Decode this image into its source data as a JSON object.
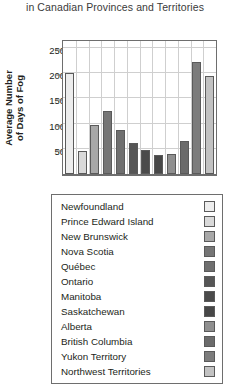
{
  "chart_data": {
    "type": "bar",
    "title": "in Canadian Provinces and Territories",
    "xlabel": "",
    "ylabel": "Average Number of Days of Fog",
    "ylim": [
      0,
      270
    ],
    "yticks": [
      50,
      100,
      150,
      200,
      250
    ],
    "grid": true,
    "legend_position": "below",
    "categories": [
      "Newfoundland",
      "Prince Edward Island",
      "New Brunswick",
      "Nova Scotia",
      "Québec",
      "Ontario",
      "Manitoba",
      "Saskatchewan",
      "Alberta",
      "British Columbia",
      "Yukon Territory",
      "Northwest Territories"
    ],
    "values": [
      205,
      46,
      100,
      127,
      89,
      62,
      48,
      38,
      40,
      68,
      227,
      198
    ],
    "colors": [
      "#ededed",
      "#d9d9d9",
      "#a8a8a8",
      "#757575",
      "#6f6f6f",
      "#565656",
      "#4b4b4b",
      "#474747",
      "#8f8f8f",
      "#6b6b6b",
      "#7c7c7c",
      "#c2c2c2"
    ]
  },
  "chart": {
    "title": "in Canadian Provinces and Territories",
    "y_axis_label": "Average Number of Days of Fog",
    "y_axis_label_line1": "Average Number",
    "y_axis_label_line2": "of Days of Fog"
  }
}
